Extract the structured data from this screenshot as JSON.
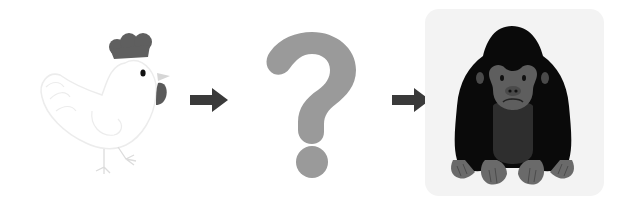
{
  "scene": {
    "description": "Illustrated sequence: rooster, arrow, question mark, arrow, gorilla",
    "sequence": [
      {
        "item": "rooster",
        "label": "Rooster"
      },
      {
        "item": "arrow",
        "label": "Right arrow"
      },
      {
        "item": "question-mark",
        "label": "?"
      },
      {
        "item": "arrow",
        "label": "Right arrow"
      },
      {
        "item": "gorilla",
        "label": "Gorilla"
      }
    ],
    "question_glyph": "?"
  },
  "colors": {
    "background": "#ffffff",
    "rooster_outline": "#efefef",
    "rooster_comb": "#5f5f5f",
    "rooster_eye": "#111111",
    "rooster_beak": "#d6d6d6",
    "rooster_wattle": "#5a5a5a",
    "arrow": "#3a3a3a",
    "question_mark": "#9a9a9a",
    "gorilla_panel": "#f3f3f3",
    "gorilla_body": "#0a0a0a",
    "gorilla_chest": "#2e2e2e",
    "gorilla_face": "#5e5e5e",
    "gorilla_hands": "#6a6a6a"
  }
}
